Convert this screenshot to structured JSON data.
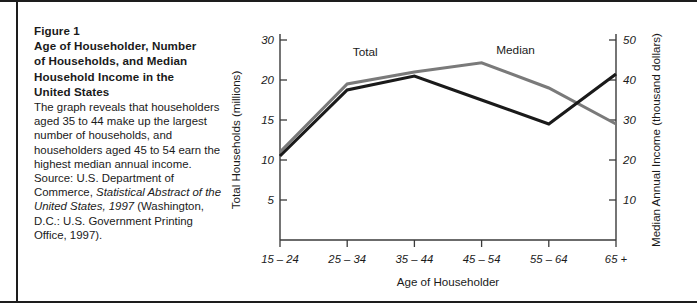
{
  "figure": {
    "number_label": "Figure 1",
    "title_lines": [
      "Age of Householder, Number",
      "of Households, and Median",
      "Household Income in the",
      "United States"
    ],
    "body_text": "The graph reveals that householders aged 35 to 44 make up the largest number of households, and householders aged 45 to 54 earn the highest median annual income. Source: U.S. Department of Commerce, ",
    "body_italic": "Statistical Abstract of the United States, 1997",
    "body_tail": " (Washington, D.C.: U.S. Government Printing Office, 1997)."
  },
  "chart_data": {
    "type": "line",
    "title": "",
    "xlabel": "Age of Householder",
    "ylabel": "Total Households (millions)",
    "y2label": "Median Annual Income (thousand dollars)",
    "categories": [
      "15 – 24",
      "25 – 34",
      "35 – 44",
      "45 – 54",
      "55 – 64",
      "65 +"
    ],
    "grid": false,
    "legend_position": "inline-labels",
    "ylim": [
      0,
      30
    ],
    "yticks": [
      5,
      10,
      15,
      20,
      30
    ],
    "y2lim": [
      0,
      50
    ],
    "y2ticks": [
      10,
      20,
      30,
      40,
      50
    ],
    "series": [
      {
        "name": "Total",
        "axis": "left",
        "units": "millions of households",
        "color": "#7a7a7a",
        "values": [
          11.0,
          19.5,
          22.0,
          24.3,
          19.0,
          14.5
        ]
      },
      {
        "name": "Median",
        "axis": "right",
        "units": "thousand dollars",
        "color": "#1a1a1a",
        "values": [
          21.0,
          37.5,
          41.0,
          35.0,
          29.0,
          41.5
        ]
      }
    ],
    "annotations": [
      {
        "text": "Total",
        "near_category": "25 – 34"
      },
      {
        "text": "Median",
        "near_category": "45 – 54"
      }
    ]
  }
}
